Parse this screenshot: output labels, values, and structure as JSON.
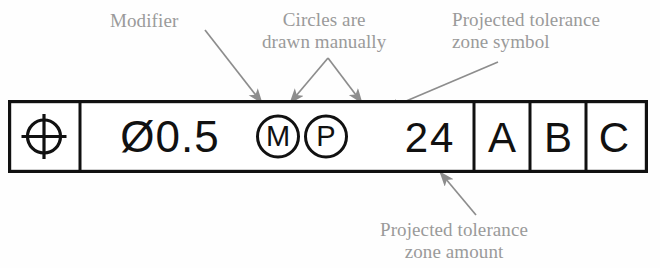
{
  "diagram": {
    "colors": {
      "line": "#111111",
      "annotation_text": "#9a9a9a",
      "leader": "#8d8d8d",
      "background": "#fefefe"
    }
  },
  "feature_control_frame": {
    "cells": [
      {
        "id": "geometric-characteristic",
        "type": "symbol",
        "symbol_name": "position-symbol",
        "label": "Position (circle with cross)"
      },
      {
        "id": "tolerance-zone",
        "type": "text",
        "value": "Ø0.5"
      },
      {
        "id": "material-condition-modifier",
        "type": "circled-letter",
        "value": "M",
        "meaning": "Maximum Material Condition"
      },
      {
        "id": "projected-tolerance-zone-symbol",
        "type": "circled-letter",
        "value": "P",
        "meaning": "Projected Tolerance Zone"
      },
      {
        "id": "projected-tolerance-zone-amount",
        "type": "text",
        "value": "24"
      },
      {
        "id": "datum-primary",
        "type": "text",
        "value": "A"
      },
      {
        "id": "datum-secondary",
        "type": "text",
        "value": "B"
      },
      {
        "id": "datum-tertiary",
        "type": "text",
        "value": "C"
      }
    ]
  },
  "annotations": [
    {
      "id": "modifier",
      "text": "Modifier",
      "target": "material-condition-modifier"
    },
    {
      "id": "circles-manual",
      "text": "Circles are\ndrawn manually",
      "target": "circled-letters"
    },
    {
      "id": "projected-zone-symbol",
      "text": "Projected tolerance\nzone symbol",
      "target": "projected-tolerance-zone-symbol"
    },
    {
      "id": "projected-zone-amount",
      "text": "Projected tolerance\nzone amount",
      "target": "projected-tolerance-zone-amount"
    }
  ]
}
